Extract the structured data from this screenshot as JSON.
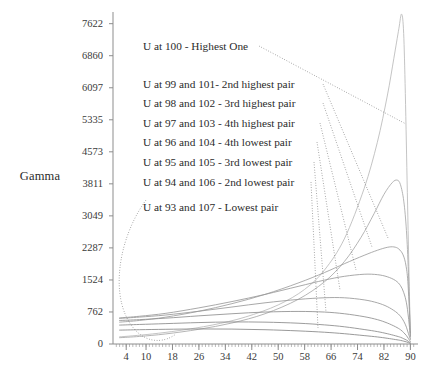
{
  "chart_data": {
    "type": "line",
    "title": "",
    "xlabel": "",
    "ylabel": "Gamma",
    "grid": false,
    "legend_position": "inside-upper-left",
    "xlim": [
      0,
      92
    ],
    "ylim": [
      0,
      7900
    ],
    "xticks": [
      4,
      10,
      18,
      26,
      34,
      42,
      50,
      58,
      66,
      74,
      82,
      90
    ],
    "yticks": [
      0,
      762,
      1524,
      2287,
      3049,
      3811,
      4573,
      5335,
      6097,
      6860,
      7622
    ],
    "x_minor_ticks": true,
    "legend_entries": [
      "U at 100 - Highest One",
      "U at 99 and 101- 2nd highest pair",
      "U at 98 and 102 - 3rd highest pair",
      "U at 97 and 103 - 4th highest pair",
      "U at 96 and 104 - 4th lowest pair",
      "U at 95 and 105 - 3rd lowest pair",
      "U at 94 and 106 - 2nd lowest pair",
      "U at 93 and 107 - Lowest pair"
    ],
    "series": [
      {
        "name": "U at 100 - Highest One",
        "color": "#b9b9b9",
        "points": [
          [
            2,
            170
          ],
          [
            6,
            195
          ],
          [
            12,
            240
          ],
          [
            20,
            320
          ],
          [
            30,
            450
          ],
          [
            40,
            640
          ],
          [
            50,
            930
          ],
          [
            58,
            1300
          ],
          [
            64,
            1760
          ],
          [
            70,
            2500
          ],
          [
            76,
            3700
          ],
          [
            80,
            4800
          ],
          [
            83,
            5900
          ],
          [
            85,
            6800
          ],
          [
            86.5,
            7500
          ],
          [
            87.3,
            7850
          ],
          [
            87.9,
            7500
          ],
          [
            88.4,
            6200
          ],
          [
            89,
            3900
          ],
          [
            89.6,
            1600
          ],
          [
            90,
            120
          ]
        ]
      },
      {
        "name": "U at 99 and 101- 2nd highest pair",
        "color": "#a8a8a8",
        "points": [
          [
            2,
            150
          ],
          [
            8,
            180
          ],
          [
            16,
            240
          ],
          [
            26,
            350
          ],
          [
            36,
            500
          ],
          [
            46,
            720
          ],
          [
            56,
            1060
          ],
          [
            64,
            1480
          ],
          [
            70,
            1960
          ],
          [
            75,
            2530
          ],
          [
            79,
            3100
          ],
          [
            82,
            3560
          ],
          [
            84.5,
            3840
          ],
          [
            86,
            3900
          ],
          [
            87,
            3790
          ],
          [
            88,
            3400
          ],
          [
            88.8,
            2700
          ],
          [
            89.4,
            1700
          ],
          [
            90,
            200
          ]
        ]
      },
      {
        "name": "U at 98 and 102 - 3rd highest pair",
        "color": "#9e9e9e",
        "points": [
          [
            2,
            520
          ],
          [
            8,
            560
          ],
          [
            16,
            640
          ],
          [
            26,
            780
          ],
          [
            36,
            960
          ],
          [
            46,
            1180
          ],
          [
            56,
            1450
          ],
          [
            64,
            1700
          ],
          [
            70,
            1910
          ],
          [
            76,
            2110
          ],
          [
            80,
            2230
          ],
          [
            83,
            2300
          ],
          [
            85,
            2310
          ],
          [
            86.5,
            2260
          ],
          [
            87.8,
            2120
          ],
          [
            88.7,
            1850
          ],
          [
            89.3,
            1400
          ],
          [
            90,
            260
          ]
        ]
      },
      {
        "name": "U at 97 and 103 - 4th highest pair",
        "color": "#9a9a9a",
        "points": [
          [
            2,
            620
          ],
          [
            8,
            660
          ],
          [
            16,
            730
          ],
          [
            26,
            860
          ],
          [
            36,
            1010
          ],
          [
            46,
            1180
          ],
          [
            56,
            1370
          ],
          [
            64,
            1520
          ],
          [
            70,
            1610
          ],
          [
            76,
            1660
          ],
          [
            80,
            1650
          ],
          [
            83,
            1600
          ],
          [
            85.5,
            1510
          ],
          [
            87,
            1390
          ],
          [
            88,
            1220
          ],
          [
            88.8,
            980
          ],
          [
            89.4,
            640
          ],
          [
            90,
            180
          ]
        ]
      },
      {
        "name": "U at 96 and 104 - 4th lowest pair",
        "color": "#989898",
        "points": [
          [
            2,
            610
          ],
          [
            8,
            640
          ],
          [
            16,
            690
          ],
          [
            26,
            780
          ],
          [
            36,
            880
          ],
          [
            46,
            980
          ],
          [
            56,
            1060
          ],
          [
            64,
            1100
          ],
          [
            70,
            1100
          ],
          [
            76,
            1050
          ],
          [
            80,
            980
          ],
          [
            83,
            890
          ],
          [
            85.5,
            770
          ],
          [
            87,
            660
          ],
          [
            88,
            540
          ],
          [
            88.8,
            400
          ],
          [
            89.4,
            250
          ],
          [
            90,
            110
          ]
        ]
      },
      {
        "name": "U at 95 and 105 - 3rd lowest pair",
        "color": "#8f8f8f",
        "points": [
          [
            2,
            560
          ],
          [
            8,
            580
          ],
          [
            16,
            615
          ],
          [
            26,
            670
          ],
          [
            36,
            720
          ],
          [
            46,
            760
          ],
          [
            56,
            775
          ],
          [
            64,
            760
          ],
          [
            70,
            720
          ],
          [
            76,
            650
          ],
          [
            80,
            580
          ],
          [
            83,
            500
          ],
          [
            85.5,
            410
          ],
          [
            87,
            340
          ],
          [
            88,
            270
          ],
          [
            88.8,
            200
          ],
          [
            89.4,
            130
          ],
          [
            90,
            60
          ]
        ]
      },
      {
        "name": "U at 94 and 106 - 2nd lowest pair",
        "color": "#8a8a8a",
        "points": [
          [
            2,
            450
          ],
          [
            8,
            465
          ],
          [
            16,
            485
          ],
          [
            26,
            510
          ],
          [
            36,
            525
          ],
          [
            46,
            520
          ],
          [
            56,
            495
          ],
          [
            64,
            455
          ],
          [
            70,
            410
          ],
          [
            76,
            345
          ],
          [
            80,
            295
          ],
          [
            83,
            245
          ],
          [
            85.5,
            195
          ],
          [
            87,
            160
          ],
          [
            88,
            125
          ],
          [
            88.8,
            95
          ],
          [
            89.4,
            62
          ],
          [
            90,
            30
          ]
        ]
      },
      {
        "name": "U at 93 and 107 - Lowest pair",
        "color": "#868686",
        "points": [
          [
            2,
            330
          ],
          [
            8,
            340
          ],
          [
            16,
            350
          ],
          [
            26,
            358
          ],
          [
            36,
            355
          ],
          [
            46,
            340
          ],
          [
            56,
            312
          ],
          [
            64,
            280
          ],
          [
            70,
            245
          ],
          [
            76,
            200
          ],
          [
            80,
            168
          ],
          [
            83,
            136
          ],
          [
            85.5,
            106
          ],
          [
            87,
            86
          ],
          [
            88,
            67
          ],
          [
            88.8,
            50
          ],
          [
            89.4,
            33
          ],
          [
            90,
            15
          ]
        ]
      }
    ],
    "leader_lines": [
      {
        "from_label": "U at 100 - Highest One",
        "style": "dotted",
        "path": "M 259 46 L 406 124"
      },
      {
        "from_label": "U at 99 and 101- 2nd highest pair",
        "style": "dotted",
        "path": "M 323 84 L 388 238"
      },
      {
        "from_label": "U at 98 and 102 - 3rd highest pair",
        "style": "dotted",
        "path": "M 323 103 L 372 247"
      },
      {
        "from_label": "U at 97 and 103 - 4th highest pair",
        "style": "dotted",
        "path": "M 320 123 L 356 270"
      },
      {
        "from_label": "U at 96 and 104 - 4th lowest pair",
        "style": "dotted",
        "path": "M 317 142 L 340 290"
      },
      {
        "from_label": "U at 95 and 105 - 3rd lowest pair",
        "style": "dotted",
        "path": "M 314 162 L 326 312"
      },
      {
        "from_label": "U at 94 and 106 - 2nd lowest pair",
        "style": "dotted",
        "path": "M 311 182 L 318 328"
      },
      {
        "from_label": "U at 93 and 107 - Lowest pair",
        "style": "dotted-curve",
        "path": "M 146 200 C 120 236 112 286 126 316 C 138 342 160 346 176 334"
      }
    ]
  },
  "geometry": {
    "plot_left": 113,
    "plot_right": 417,
    "plot_top": 12,
    "plot_bottom": 344
  },
  "colors": {
    "axis": "#8d8d8d",
    "text": "#2b2b2b",
    "curve_default": "#9a9a9a",
    "background": "#ffffff"
  }
}
